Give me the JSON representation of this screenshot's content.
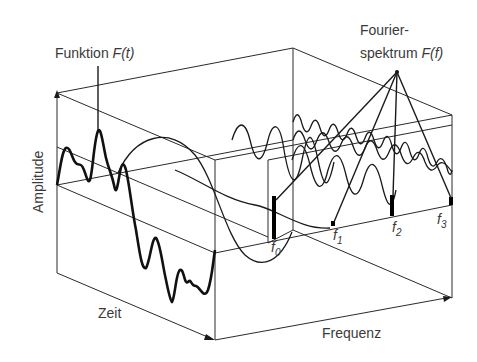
{
  "labels": {
    "function": {
      "text": "Funktion ",
      "var": "F(t)"
    },
    "spectrum": {
      "line1": "Fourier-",
      "line2": "spektrum ",
      "var": "F(f)"
    },
    "amplitude_axis": "Amplitude",
    "time_axis": "Zeit",
    "frequency_axis": "Frequenz"
  },
  "frequencies": [
    {
      "symbol": "f",
      "sub": "0"
    },
    {
      "symbol": "f",
      "sub": "1"
    },
    {
      "symbol": "f",
      "sub": "2"
    },
    {
      "symbol": "f",
      "sub": "3"
    }
  ],
  "colors": {
    "line": "#1a1a1a",
    "text": "#3a3a3a",
    "background": "#ffffff"
  }
}
